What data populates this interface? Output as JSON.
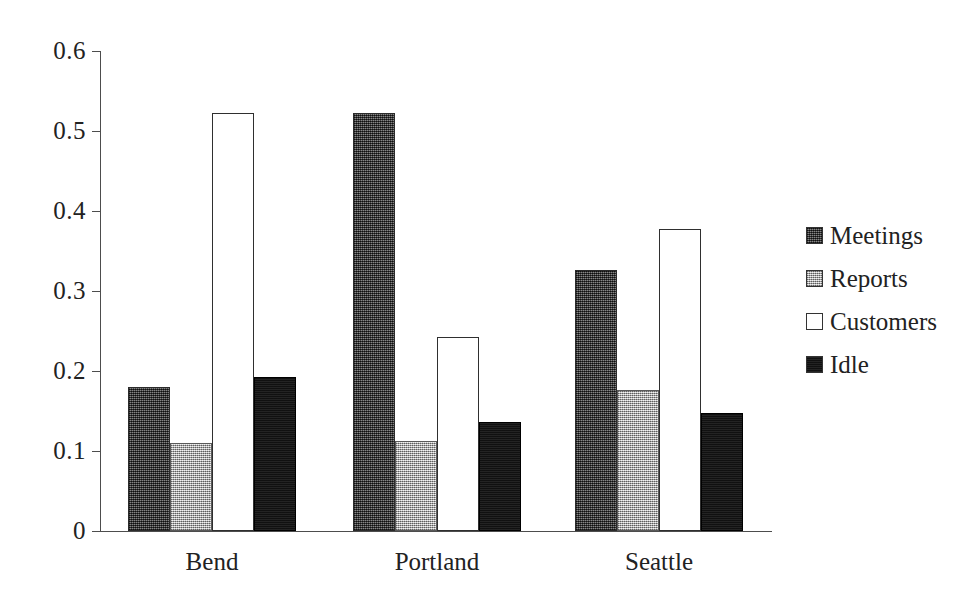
{
  "chart_data": {
    "type": "bar",
    "title": "",
    "xlabel": "",
    "ylabel": "",
    "categories": [
      "Bend",
      "Portland",
      "Seattle"
    ],
    "series": [
      {
        "name": "Meetings",
        "values": [
          0.18,
          0.522,
          0.326
        ],
        "color": "#4a4a4a",
        "pattern": "dark-crosshatch"
      },
      {
        "name": "Reports",
        "values": [
          0.11,
          0.113,
          0.176
        ],
        "color": "#c3c3c3",
        "pattern": "light-dotted"
      },
      {
        "name": "Customers",
        "values": [
          0.522,
          0.243,
          0.377
        ],
        "color": "#ffffff",
        "pattern": "open-outline"
      },
      {
        "name": "Idle",
        "values": [
          0.192,
          0.136,
          0.148
        ],
        "color": "#171717",
        "pattern": "solid-black"
      }
    ],
    "ylim": [
      0,
      0.6
    ],
    "y_ticks": [
      0,
      0.1,
      0.2,
      0.3,
      0.4,
      0.5,
      0.6
    ],
    "y_tick_labels": [
      "0",
      "0.1",
      "0.2",
      "0.3",
      "0.4",
      "0.5",
      "0.6"
    ],
    "grid": false,
    "legend_position": "right"
  },
  "axis": {
    "y_tick_labels": [
      "0.6",
      "0.5",
      "0.4",
      "0.3",
      "0.2",
      "0.1",
      "0"
    ]
  },
  "legend": {
    "items": [
      {
        "label": "Meetings"
      },
      {
        "label": "Reports"
      },
      {
        "label": "Customers"
      },
      {
        "label": "Idle"
      }
    ]
  }
}
